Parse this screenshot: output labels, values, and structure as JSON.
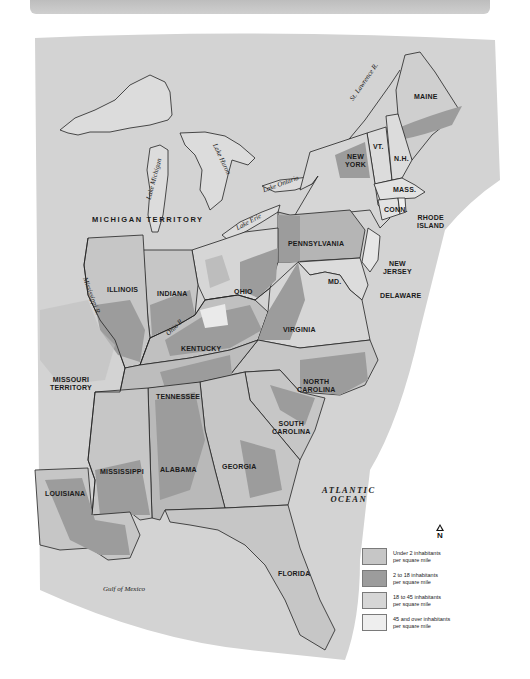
{
  "map": {
    "title": "",
    "colors": {
      "background": "#ffffff",
      "land_under_2": "#c6c6c6",
      "land_2_to_18": "#9c9c9c",
      "land_18_to_45": "#d6d6d6",
      "land_45_over": "#eeeeee",
      "water": "#d9d9d9",
      "border": "#222222"
    },
    "states": [
      {
        "id": "maine",
        "label": "MAINE"
      },
      {
        "id": "vermont",
        "label": "VT."
      },
      {
        "id": "new-hampshire",
        "label": "N.H."
      },
      {
        "id": "new-york",
        "label": "NEW\nYORK"
      },
      {
        "id": "massachusetts",
        "label": "MASS."
      },
      {
        "id": "connecticut",
        "label": "CONN."
      },
      {
        "id": "rhode-island",
        "label": "RHODE\nISLAND"
      },
      {
        "id": "pennsylvania",
        "label": "PENNSYLVANIA"
      },
      {
        "id": "new-jersey",
        "label": "NEW\nJERSEY"
      },
      {
        "id": "maryland",
        "label": "MD."
      },
      {
        "id": "delaware",
        "label": "DELAWARE"
      },
      {
        "id": "ohio",
        "label": "OHIO"
      },
      {
        "id": "indiana",
        "label": "INDIANA"
      },
      {
        "id": "illinois",
        "label": "ILLINOIS"
      },
      {
        "id": "kentucky",
        "label": "KENTUCKY"
      },
      {
        "id": "virginia",
        "label": "VIRGINIA"
      },
      {
        "id": "north-carolina",
        "label": "NORTH\nCAROLINA"
      },
      {
        "id": "south-carolina",
        "label": "SOUTH\nCAROLINA"
      },
      {
        "id": "tennessee",
        "label": "TENNESSEE"
      },
      {
        "id": "georgia",
        "label": "GEORGIA"
      },
      {
        "id": "alabama",
        "label": "ALABAMA"
      },
      {
        "id": "mississippi",
        "label": "MISSISSIPPI"
      },
      {
        "id": "louisiana",
        "label": "LOUISIANA"
      },
      {
        "id": "florida",
        "label": "FLORIDA"
      },
      {
        "id": "michigan-territory",
        "label": "MICHIGAN TERRITORY"
      },
      {
        "id": "missouri-territory",
        "label": "MISSOURI\nTERRITORY"
      }
    ],
    "water_labels": {
      "st_lawrence": "St. Lawrence R.",
      "lake_michigan": "Lake Michigan",
      "lake_huron": "Lake Huron",
      "lake_ontario": "Lake Ontario",
      "lake_erie": "Lake Erie",
      "mississippi": "Mississippi R.",
      "ohio_r": "Ohio R.",
      "gulf": "Gulf of Mexico",
      "atlantic": "ATLANTIC\nOCEAN"
    },
    "compass": {
      "label": "N"
    },
    "legend": [
      {
        "label": "Under 2 inhabitants\nper square mile",
        "color": "#c6c6c6"
      },
      {
        "label": "2 to 18 inhabitants\nper square mile",
        "color": "#9c9c9c"
      },
      {
        "label": "18 to 45 inhabitants\nper square mile",
        "color": "#d6d6d6"
      },
      {
        "label": "45 and over inhabitants\nper square mile",
        "color": "#eeeeee"
      }
    ]
  }
}
